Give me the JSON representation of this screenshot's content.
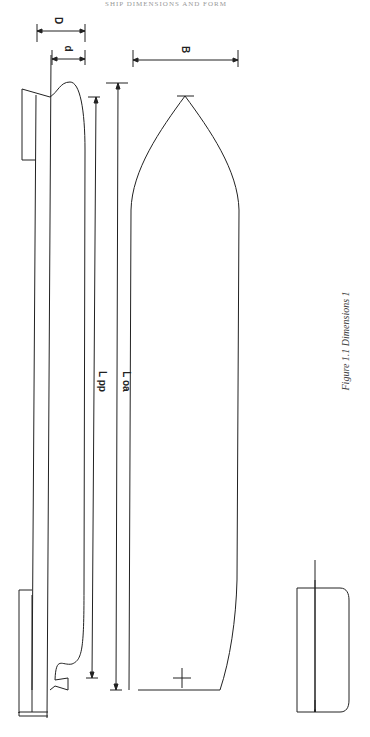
{
  "header": {
    "text": "SHIP DIMENSIONS AND FORM"
  },
  "caption": {
    "text": "Figure 1.1 Dimensions 1"
  },
  "labels": {
    "profile_depth": "D",
    "profile_draught": "d",
    "plan_breadth": "B",
    "length_pp": "L pp",
    "length_oa": "L oa",
    "section_depth": "D",
    "section_draught": "d",
    "section_breadth": "B"
  },
  "views": [
    {
      "name": "Profile (side elevation)"
    },
    {
      "name": "Plan (waterline)"
    },
    {
      "name": "Midship section"
    }
  ],
  "colors": {
    "line": "#222222",
    "background": "#ffffff"
  }
}
